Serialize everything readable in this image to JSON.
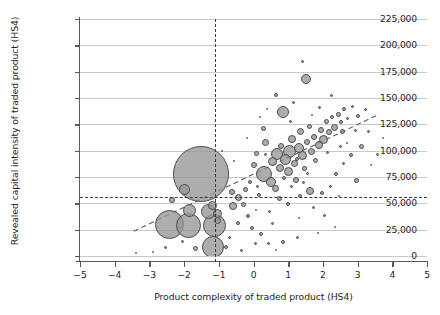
{
  "chart_data": {
    "type": "scatter",
    "title": "",
    "xlabel": "Product complexity of traded product (HS4)",
    "ylabel": "Revealed capital intensity of traded product (HS4)",
    "xlim": [
      -5,
      5
    ],
    "ylim": [
      0,
      225000
    ],
    "grid": true,
    "legend_position": "none",
    "bubble_note": "Marker area encodes trade value (unlabelled)",
    "xticks": [
      {
        "value": -5,
        "label": "−5"
      },
      {
        "value": -4,
        "label": "−4"
      },
      {
        "value": -3,
        "label": "−3"
      },
      {
        "value": -2,
        "label": "−2"
      },
      {
        "value": -1,
        "label": "−1"
      },
      {
        "value": 0,
        "label": "0"
      },
      {
        "value": 1,
        "label": "1"
      },
      {
        "value": 2,
        "label": "2"
      },
      {
        "value": 3,
        "label": "3"
      },
      {
        "value": 4,
        "label": "4"
      },
      {
        "value": 5,
        "label": "5"
      }
    ],
    "yticks": [
      {
        "value": 0,
        "label": "0"
      },
      {
        "value": 25000,
        "label": "25,000"
      },
      {
        "value": 50000,
        "label": "50,000"
      },
      {
        "value": 75000,
        "label": "75,000"
      },
      {
        "value": 100000,
        "label": "100,000"
      },
      {
        "value": 125000,
        "label": "125,000"
      },
      {
        "value": 150000,
        "label": "150,000"
      },
      {
        "value": 175000,
        "label": "175,000"
      },
      {
        "value": 200000,
        "label": "200,000"
      },
      {
        "value": 225000,
        "label": "225,000"
      }
    ],
    "reference_lines": [
      {
        "name": "vertical-complexity-threshold",
        "orientation": "vertical",
        "value": -1.1,
        "style": "dashed"
      },
      {
        "name": "horizontal-capital-intensity-threshold",
        "orientation": "horizontal",
        "value": 56000,
        "style": "dashed"
      }
    ],
    "trend_line": {
      "name": "fitted-trend-line",
      "style": "dashed",
      "x0": -3.45,
      "y0": 23500,
      "x1": 3.55,
      "y1": 133500
    },
    "points": [
      {
        "x": -1.52,
        "y": 78000,
        "size": 56
      },
      {
        "x": -2.42,
        "y": 29500,
        "size": 29
      },
      {
        "x": -1.86,
        "y": 28500,
        "size": 25
      },
      {
        "x": -1.12,
        "y": 29000,
        "size": 23
      },
      {
        "x": -1.18,
        "y": 8500,
        "size": 22
      },
      {
        "x": -1.3,
        "y": 42500,
        "size": 15
      },
      {
        "x": -1.84,
        "y": 43500,
        "size": 13
      },
      {
        "x": -2.0,
        "y": 63500,
        "size": 11
      },
      {
        "x": -1.17,
        "y": 47500,
        "size": 9
      },
      {
        "x": -1.05,
        "y": 40500,
        "size": 9
      },
      {
        "x": -1.04,
        "y": 34000,
        "size": 7
      },
      {
        "x": -2.36,
        "y": 53000,
        "size": 6
      },
      {
        "x": -1.68,
        "y": 7000,
        "size": 5
      },
      {
        "x": -0.8,
        "y": 8500,
        "size": 4
      },
      {
        "x": -2.05,
        "y": 13500,
        "size": 3
      },
      {
        "x": -2.55,
        "y": 8500,
        "size": 3
      },
      {
        "x": -0.62,
        "y": 61000,
        "size": 6
      },
      {
        "x": -0.58,
        "y": 47500,
        "size": 8
      },
      {
        "x": -0.42,
        "y": 55500,
        "size": 7
      },
      {
        "x": -0.3,
        "y": 49000,
        "size": 5
      },
      {
        "x": -0.22,
        "y": 63000,
        "size": 5
      },
      {
        "x": -0.15,
        "y": 38000,
        "size": 4
      },
      {
        "x": -0.46,
        "y": 31000,
        "size": 4
      },
      {
        "x": -0.05,
        "y": 26500,
        "size": 4
      },
      {
        "x": 0.22,
        "y": 21000,
        "size": 4
      },
      {
        "x": 0.05,
        "y": 12000,
        "size": 3
      },
      {
        "x": 0.42,
        "y": 11500,
        "size": 3
      },
      {
        "x": 0.86,
        "y": 13000,
        "size": 4
      },
      {
        "x": 1.26,
        "y": 18000,
        "size": 3
      },
      {
        "x": 0.0,
        "y": 86000,
        "size": 6
      },
      {
        "x": 0.1,
        "y": 97000,
        "size": 5
      },
      {
        "x": 0.28,
        "y": 121000,
        "size": 5
      },
      {
        "x": 0.36,
        "y": 108000,
        "size": 7
      },
      {
        "x": 0.3,
        "y": 78000,
        "size": 16
      },
      {
        "x": 0.5,
        "y": 70500,
        "size": 10
      },
      {
        "x": 0.62,
        "y": 64000,
        "size": 7
      },
      {
        "x": 0.55,
        "y": 90000,
        "size": 9
      },
      {
        "x": 0.68,
        "y": 96500,
        "size": 12
      },
      {
        "x": 0.76,
        "y": 84000,
        "size": 8
      },
      {
        "x": 0.8,
        "y": 104000,
        "size": 6
      },
      {
        "x": 0.92,
        "y": 92000,
        "size": 11
      },
      {
        "x": 1.0,
        "y": 80000,
        "size": 9
      },
      {
        "x": 1.05,
        "y": 99000,
        "size": 13
      },
      {
        "x": 1.12,
        "y": 111000,
        "size": 8
      },
      {
        "x": 1.18,
        "y": 88000,
        "size": 7
      },
      {
        "x": 1.22,
        "y": 72000,
        "size": 6
      },
      {
        "x": 1.3,
        "y": 103000,
        "size": 10
      },
      {
        "x": 1.36,
        "y": 118000,
        "size": 7
      },
      {
        "x": 1.42,
        "y": 95000,
        "size": 9
      },
      {
        "x": 1.48,
        "y": 83000,
        "size": 5
      },
      {
        "x": 1.55,
        "y": 108000,
        "size": 6
      },
      {
        "x": 1.6,
        "y": 123000,
        "size": 5
      },
      {
        "x": 1.66,
        "y": 99000,
        "size": 7
      },
      {
        "x": 1.74,
        "y": 113000,
        "size": 6
      },
      {
        "x": 1.8,
        "y": 91000,
        "size": 5
      },
      {
        "x": 1.88,
        "y": 105000,
        "size": 8
      },
      {
        "x": 1.95,
        "y": 120000,
        "size": 6
      },
      {
        "x": 2.02,
        "y": 111000,
        "size": 9
      },
      {
        "x": 2.1,
        "y": 128000,
        "size": 5
      },
      {
        "x": 2.18,
        "y": 118000,
        "size": 6
      },
      {
        "x": 2.26,
        "y": 132000,
        "size": 4
      },
      {
        "x": 2.34,
        "y": 122000,
        "size": 7
      },
      {
        "x": 2.44,
        "y": 134000,
        "size": 5
      },
      {
        "x": 2.52,
        "y": 127000,
        "size": 4
      },
      {
        "x": 2.62,
        "y": 140000,
        "size": 4
      },
      {
        "x": 2.72,
        "y": 131000,
        "size": 3
      },
      {
        "x": 2.84,
        "y": 142000,
        "size": 3
      },
      {
        "x": 0.86,
        "y": 137000,
        "size": 12
      },
      {
        "x": 1.52,
        "y": 168000,
        "size": 10
      },
      {
        "x": 1.42,
        "y": 185000,
        "size": 3
      },
      {
        "x": 0.64,
        "y": 153000,
        "size": 4
      },
      {
        "x": 1.16,
        "y": 146000,
        "size": 3
      },
      {
        "x": 1.9,
        "y": 141000,
        "size": 3
      },
      {
        "x": 2.25,
        "y": 152000,
        "size": 3
      },
      {
        "x": 2.56,
        "y": 118000,
        "size": 5
      },
      {
        "x": 3.02,
        "y": 133000,
        "size": 4
      },
      {
        "x": 3.22,
        "y": 139000,
        "size": 3
      },
      {
        "x": 2.94,
        "y": 119000,
        "size": 3
      },
      {
        "x": 3.1,
        "y": 104000,
        "size": 5
      },
      {
        "x": 2.8,
        "y": 96000,
        "size": 4
      },
      {
        "x": 2.6,
        "y": 88000,
        "size": 3
      },
      {
        "x": 2.38,
        "y": 78000,
        "size": 4
      },
      {
        "x": 2.96,
        "y": 72000,
        "size": 5
      },
      {
        "x": 3.32,
        "y": 118000,
        "size": 3
      },
      {
        "x": 1.34,
        "y": 57000,
        "size": 4
      },
      {
        "x": 1.64,
        "y": 62000,
        "size": 8
      },
      {
        "x": 1.98,
        "y": 60000,
        "size": 4
      },
      {
        "x": 2.22,
        "y": 66000,
        "size": 3
      },
      {
        "x": 0.74,
        "y": 55000,
        "size": 5
      },
      {
        "x": 0.98,
        "y": 49000,
        "size": 4
      },
      {
        "x": 1.74,
        "y": 46000,
        "size": 3
      },
      {
        "x": 2.06,
        "y": 38000,
        "size": 3
      },
      {
        "x": 0.46,
        "y": 42000,
        "size": 3
      },
      {
        "x": 0.16,
        "y": 58000,
        "size": 4
      },
      {
        "x": -0.1,
        "y": 70000,
        "size": 4
      },
      {
        "x": 0.12,
        "y": 66000,
        "size": 3
      },
      {
        "x": 3.56,
        "y": 96000,
        "size": 3
      },
      {
        "x": 3.74,
        "y": 112000,
        "size": 2
      },
      {
        "x": 0.56,
        "y": 31000,
        "size": 3
      },
      {
        "x": -0.7,
        "y": 18000,
        "size": 3
      },
      {
        "x": -0.34,
        "y": 5000,
        "size": 3
      },
      {
        "x": 0.66,
        "y": 6000,
        "size": 2
      },
      {
        "x": 1.86,
        "y": 22000,
        "size": 2
      },
      {
        "x": -3.4,
        "y": 3000,
        "size": 2
      },
      {
        "x": -2.9,
        "y": 4000,
        "size": 2
      },
      {
        "x": 2.46,
        "y": 57000,
        "size": 2
      },
      {
        "x": 3.4,
        "y": 86000,
        "size": 2
      },
      {
        "x": 0.4,
        "y": 140000,
        "size": 2
      },
      {
        "x": 1.08,
        "y": 128000,
        "size": 3
      },
      {
        "x": 0.2,
        "y": 132000,
        "size": 2
      },
      {
        "x": 1.7,
        "y": 134000,
        "size": 2
      },
      {
        "x": 2.7,
        "y": 107000,
        "size": 2
      },
      {
        "x": -0.9,
        "y": 100000,
        "size": 2
      },
      {
        "x": -0.55,
        "y": 90000,
        "size": 2
      },
      {
        "x": 1.44,
        "y": 70000,
        "size": 3
      },
      {
        "x": 2.14,
        "y": 98000,
        "size": 3
      },
      {
        "x": 1.24,
        "y": 92000,
        "size": 4
      },
      {
        "x": 0.88,
        "y": 74000,
        "size": 4
      },
      {
        "x": 1.56,
        "y": 78000,
        "size": 3
      },
      {
        "x": 1.1,
        "y": 66000,
        "size": 3
      },
      {
        "x": 0.34,
        "y": 96000,
        "size": 3
      },
      {
        "x": 2.5,
        "y": 104000,
        "size": 3
      },
      {
        "x": -0.18,
        "y": 112000,
        "size": 2
      },
      {
        "x": 1.3,
        "y": 36000,
        "size": 2
      },
      {
        "x": 2.34,
        "y": 28000,
        "size": 2
      },
      {
        "x": 0.08,
        "y": 44000,
        "size": 2
      }
    ]
  }
}
